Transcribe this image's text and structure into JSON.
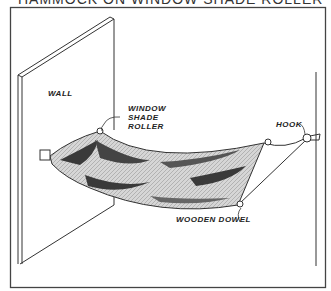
{
  "title": "HAMMOCK ON WINDOW SHADE ROLLER",
  "labels": {
    "wall": "WALL",
    "roller_line1": "WINDOW",
    "roller_line2": "SHADE",
    "roller_line3": "ROLLER",
    "hook": "HOOK",
    "dowel": "WOODEN DOWEL"
  },
  "colors": {
    "ink": "#222222",
    "fabric": "#cfcfcf",
    "fabric_dark": "#3a3a3a",
    "frame": "#444444"
  }
}
